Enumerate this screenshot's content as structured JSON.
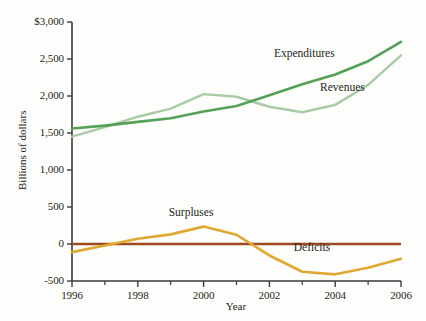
{
  "chart_data": {
    "type": "line",
    "title": "",
    "xlabel": "Year",
    "ylabel": "Billions of dollars",
    "xlim": [
      1996,
      2006
    ],
    "ylim": [
      -500,
      3000
    ],
    "grid": false,
    "legend_position": "inline-labels",
    "x": [
      1996,
      1997,
      1998,
      1999,
      2000,
      2001,
      2002,
      2003,
      2004,
      2005,
      2006
    ],
    "xticks": [
      "1996",
      "1998",
      "2000",
      "2002",
      "2004",
      "2006"
    ],
    "xtick_values": [
      1996,
      1998,
      2000,
      2002,
      2004,
      2006
    ],
    "xminor_values": [
      1997,
      1999,
      2001,
      2003,
      2005
    ],
    "yticks": [
      "$3,000",
      "2,500",
      "2,000",
      "1,500",
      "1,000",
      "500",
      "0",
      "-500"
    ],
    "ytick_values": [
      3000,
      2500,
      2000,
      1500,
      1000,
      500,
      0,
      -500
    ],
    "zero_reference_line": 0,
    "series": [
      {
        "name": "Expenditures",
        "color": "#54a057",
        "values": [
          1560,
          1600,
          1650,
          1700,
          1790,
          1865,
          2010,
          2160,
          2290,
          2470,
          2730
        ]
      },
      {
        "name": "Revenues",
        "color": "#a8cba6",
        "values": [
          1450,
          1580,
          1720,
          1830,
          2025,
          1990,
          1855,
          1780,
          1880,
          2150,
          2550
        ]
      },
      {
        "name": "Surpluses",
        "color": "#e0a832",
        "values": [
          -110,
          -20,
          70,
          130,
          235,
          125,
          -155,
          -375,
          -410,
          -320,
          -200
        ]
      }
    ],
    "annotations": [
      {
        "text": "Expenditures",
        "x": 2002.2,
        "y": 2560
      },
      {
        "text": "Revenues",
        "x": 2003.6,
        "y": 2100
      },
      {
        "text": "Surpluses",
        "x": 1999.0,
        "y": 410
      },
      {
        "text": "Deficits",
        "x": 2002.8,
        "y": -70
      }
    ],
    "colors": {
      "expenditures": "#54a057",
      "revenues": "#a8cba6",
      "surpluses_deficits": "#e0a832",
      "zero_line": "#9c4a20",
      "axis": "#3a3a3a",
      "background": "#fdfdfb",
      "text": "#231f20"
    }
  }
}
